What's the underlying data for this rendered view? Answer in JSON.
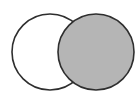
{
  "diagram": {
    "type": "venn",
    "background": "#ffffff",
    "stroke_color": "#2e2e2e",
    "circles": [
      {
        "id": "left",
        "cx": 50,
        "cy": 52,
        "r": 38,
        "fill": "#ffffff"
      },
      {
        "id": "right",
        "cx": 96,
        "cy": 52,
        "r": 38,
        "fill": "#b5b5b5"
      }
    ]
  }
}
